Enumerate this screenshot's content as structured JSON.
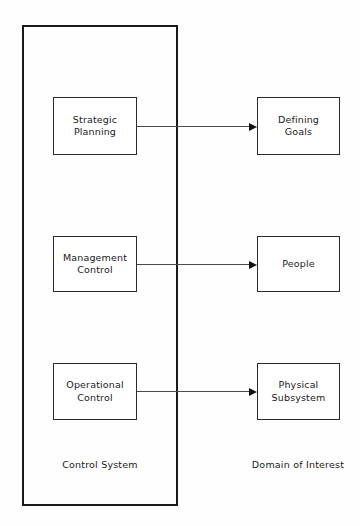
{
  "diagram": {
    "background_color": "#fefefe",
    "line_color": "#1a1a1a",
    "container": {
      "caption": "Control System"
    },
    "domain": {
      "caption": "Domain of Interest"
    },
    "rows": [
      {
        "source_label": "Strategic\nPlanning",
        "target_label": "Defining\nGoals",
        "connector": "arrow-right"
      },
      {
        "source_label": "Management\nControl",
        "target_label": "People",
        "connector": "arrow-right"
      },
      {
        "source_label": "Operational\nControl",
        "target_label": "Physical\nSubsystem",
        "connector": "arrow-right"
      }
    ]
  }
}
